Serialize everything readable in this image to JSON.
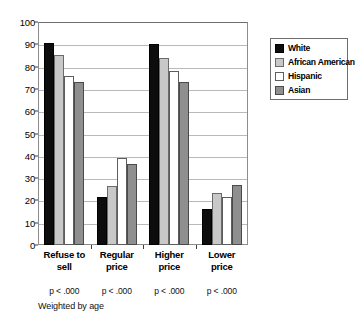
{
  "chart_data": {
    "type": "bar",
    "title": "",
    "xlabel": "",
    "ylabel": "",
    "ylim": [
      0,
      100
    ],
    "ytick_step": 10,
    "yticks": [
      "0",
      "10",
      "20",
      "30",
      "40",
      "50",
      "60",
      "70",
      "80",
      "90",
      "100"
    ],
    "grid": true,
    "legend_position": "right",
    "categories": [
      "Refuse to sell",
      "Regular price",
      "Higher price",
      "Lower price"
    ],
    "category_lines": [
      [
        "Refuse to",
        "sell"
      ],
      [
        "Regular",
        "price"
      ],
      [
        "Higher",
        "price"
      ],
      [
        "Lower",
        "price"
      ]
    ],
    "annotations": [
      "p < .000",
      "p < .000",
      "p < .000",
      "p < .000"
    ],
    "footnote": "Weighted by age",
    "series": [
      {
        "name": "White",
        "color": "#0d0d0d",
        "values": [
          90.5,
          21.5,
          90.0,
          16.0
        ]
      },
      {
        "name": "African American",
        "color": "#c8c8c8",
        "values": [
          85.0,
          26.5,
          84.0,
          23.5
        ]
      },
      {
        "name": "Hispanic",
        "color": "#ffffff",
        "values": [
          76.0,
          39.0,
          78.0,
          21.5
        ]
      },
      {
        "name": "Asian",
        "color": "#8f8f8f",
        "values": [
          73.0,
          36.5,
          73.0,
          27.0
        ]
      }
    ]
  }
}
